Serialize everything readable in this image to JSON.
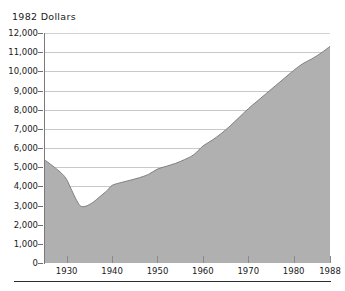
{
  "chart_data": {
    "type": "area",
    "title": "1982 Dollars",
    "xlabel": "",
    "ylabel": "",
    "xlim": [
      1925,
      1988
    ],
    "ylim": [
      0,
      12000
    ],
    "grid": true,
    "legend": "none",
    "fill_color": "#b0b0b0",
    "line_color": "#808080",
    "gridline_color": "#c9c9c9",
    "axis_color": "#7a7a7a",
    "rule_color": "#2b2b2b",
    "y_ticks": [
      {
        "value": 12000,
        "label": "12,000"
      },
      {
        "value": 11000,
        "label": "11,000"
      },
      {
        "value": 10000,
        "label": "10,000"
      },
      {
        "value": 9000,
        "label": "9,000"
      },
      {
        "value": 8000,
        "label": "8,000"
      },
      {
        "value": 7000,
        "label": "7,000"
      },
      {
        "value": 6000,
        "label": "6,000"
      },
      {
        "value": 5000,
        "label": "5,000"
      },
      {
        "value": 4000,
        "label": "4,000"
      },
      {
        "value": 3000,
        "label": "3,000"
      },
      {
        "value": 2000,
        "label": "2,000"
      },
      {
        "value": 1000,
        "label": "1,000"
      },
      {
        "value": 0,
        "label": "0"
      }
    ],
    "x_ticks": [
      {
        "value": 1930,
        "label": "1930"
      },
      {
        "value": 1940,
        "label": "1940"
      },
      {
        "value": 1950,
        "label": "1950"
      },
      {
        "value": 1960,
        "label": "1960"
      },
      {
        "value": 1970,
        "label": "1970"
      },
      {
        "value": 1980,
        "label": "1980"
      },
      {
        "value": 1988,
        "label": "1988"
      }
    ],
    "x": [
      1925,
      1927,
      1929,
      1930,
      1931,
      1932,
      1933,
      1934,
      1935,
      1936,
      1937,
      1938,
      1939,
      1940,
      1942,
      1944,
      1946,
      1948,
      1950,
      1952,
      1954,
      1956,
      1958,
      1960,
      1962,
      1964,
      1966,
      1968,
      1970,
      1972,
      1974,
      1976,
      1978,
      1980,
      1982,
      1984,
      1986,
      1988
    ],
    "values": [
      5400,
      5050,
      4650,
      4350,
      3850,
      3350,
      2980,
      2950,
      3050,
      3200,
      3400,
      3600,
      3800,
      4050,
      4200,
      4320,
      4450,
      4620,
      4900,
      5050,
      5200,
      5400,
      5650,
      6100,
      6400,
      6750,
      7150,
      7600,
      8050,
      8450,
      8850,
      9250,
      9650,
      10050,
      10400,
      10650,
      10950,
      11300
    ],
    "series_name": "Real dollars"
  }
}
